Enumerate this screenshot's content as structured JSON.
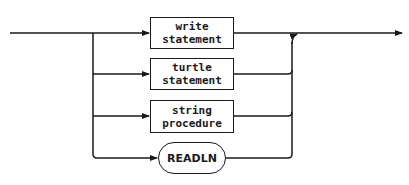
{
  "diagram": {
    "type": "syntax-diagram",
    "nodes": [
      {
        "id": "write",
        "kind": "nonterminal",
        "line1": "write",
        "line2": "statement"
      },
      {
        "id": "turtle",
        "kind": "nonterminal",
        "line1": "turtle",
        "line2": "statement"
      },
      {
        "id": "string",
        "kind": "nonterminal",
        "line1": "string",
        "line2": "procedure"
      },
      {
        "id": "readln",
        "kind": "terminal",
        "label": "READLN"
      }
    ],
    "line_color": "#1a1a1a"
  }
}
